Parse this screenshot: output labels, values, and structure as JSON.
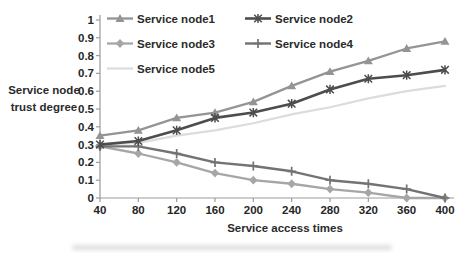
{
  "chart_data": {
    "type": "line",
    "title": "",
    "xlabel": "Service access times",
    "ylabel": "Service node trust degree",
    "ylabel_lines": [
      "Service node",
      "trust degree"
    ],
    "x": [
      40,
      80,
      120,
      160,
      200,
      240,
      280,
      320,
      360,
      400
    ],
    "x_tick_labels": [
      "40",
      "80",
      "120",
      "160",
      "200",
      "240",
      "280",
      "320",
      "360",
      "400"
    ],
    "y_tick_labels": [
      "0",
      "0.1",
      "0.2",
      "0.3",
      "0.4",
      "0.5",
      "0.6",
      "0.7",
      "0.8",
      "0.9",
      "1"
    ],
    "ylim": [
      0,
      1
    ],
    "xlim": [
      40,
      400
    ],
    "grid": false,
    "legend_position": "top-two-columns",
    "axis_color": "#9b9b9b",
    "series": [
      {
        "name": "Service node1",
        "marker_icon": "triangle-marker-icon",
        "marker": "triangle",
        "color": "#949494",
        "width": 2.3,
        "values": [
          0.35,
          0.38,
          0.45,
          0.48,
          0.54,
          0.63,
          0.71,
          0.77,
          0.84,
          0.88
        ]
      },
      {
        "name": "Service node2",
        "marker_icon": "asterisk-marker-icon",
        "marker": "asterisk",
        "color": "#4d4d4d",
        "width": 2.6,
        "values": [
          0.3,
          0.32,
          0.38,
          0.45,
          0.48,
          0.53,
          0.61,
          0.67,
          0.69,
          0.72
        ]
      },
      {
        "name": "Service node3",
        "marker_icon": "diamond-marker-icon",
        "marker": "diamond",
        "color": "#a6a6a6",
        "width": 2.3,
        "values": [
          0.29,
          0.25,
          0.2,
          0.14,
          0.1,
          0.08,
          0.05,
          0.03,
          0.0,
          0.0
        ]
      },
      {
        "name": "Service node4",
        "marker_icon": "plus-marker-icon",
        "marker": "plus",
        "color": "#737373",
        "width": 2.4,
        "values": [
          0.29,
          0.29,
          0.25,
          0.2,
          0.18,
          0.15,
          0.1,
          0.08,
          0.05,
          0.0
        ]
      },
      {
        "name": "Service node5",
        "marker_icon": "none",
        "marker": "none",
        "color": "#dcdcdc",
        "width": 2.2,
        "values": [
          0.3,
          0.31,
          0.35,
          0.38,
          0.42,
          0.47,
          0.51,
          0.56,
          0.6,
          0.63
        ]
      }
    ]
  }
}
